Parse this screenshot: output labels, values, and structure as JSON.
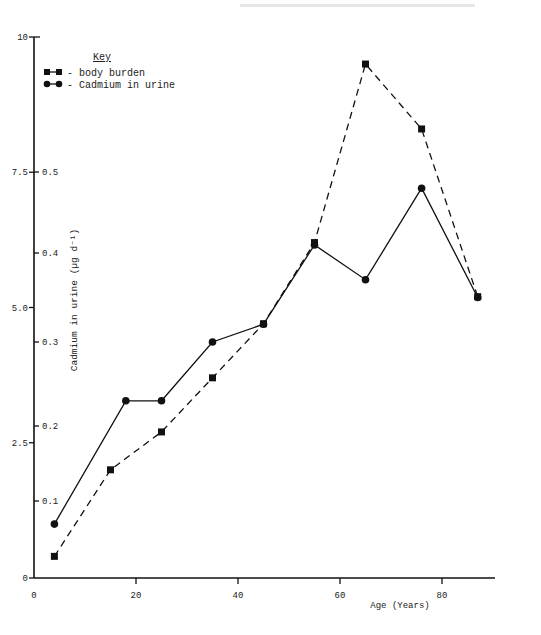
{
  "chart_data": {
    "type": "line",
    "title": "",
    "xlabel": "Age (Years)",
    "ylabel_inner": "Cadmium in urine (µg d⁻¹)",
    "ylabel_outer": "",
    "xlim": [
      0,
      90
    ],
    "x_ticks": [
      0,
      20,
      40,
      60,
      80
    ],
    "y_outer_ticks": [
      "0",
      "2.5",
      "5.0",
      "7.5",
      "10"
    ],
    "y_outer_range": [
      0,
      10
    ],
    "y_inner_ticks": [
      "0.1",
      "0.2",
      "0.3",
      "0.4",
      "0.5"
    ],
    "y_inner_range": [
      0,
      0.5
    ],
    "grid": false,
    "legend": {
      "title": "Key",
      "position": "top-left",
      "entries": [
        {
          "label": "- body burden",
          "marker": "square",
          "style": "dashed"
        },
        {
          "label": "- Cadmium in urine",
          "marker": "circle",
          "style": "solid"
        }
      ]
    },
    "series": [
      {
        "name": "body burden",
        "axis": "outer",
        "marker": "square",
        "line": "dashed",
        "x": [
          4,
          15,
          25,
          35,
          45,
          55,
          65,
          76,
          87
        ],
        "values": [
          0.4,
          2.0,
          2.7,
          3.7,
          4.7,
          6.2,
          9.5,
          8.3,
          5.2
        ]
      },
      {
        "name": "Cadmium in urine",
        "axis": "inner",
        "marker": "circle",
        "line": "solid",
        "x": [
          4,
          18,
          25,
          35,
          45,
          55,
          65,
          76,
          87
        ],
        "values": [
          0.07,
          0.23,
          0.23,
          0.3,
          0.32,
          0.41,
          0.37,
          0.48,
          0.35
        ]
      }
    ]
  }
}
